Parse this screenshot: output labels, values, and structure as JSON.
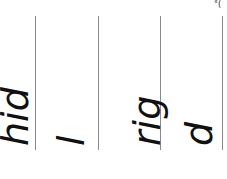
{
  "document": {
    "corner_text": "°( ",
    "columns": [
      {
        "text": "hid"
      },
      {
        "text": "l"
      },
      {
        "text": "rig"
      },
      {
        "text": "d"
      }
    ]
  }
}
